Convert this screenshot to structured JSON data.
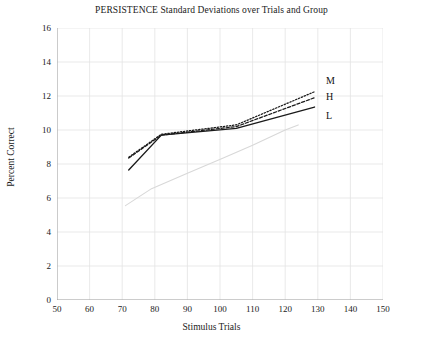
{
  "chart_data": {
    "type": "line",
    "title": "PERSISTENCE Standard Deviations over Trials and Group",
    "xlabel": "Stimulus Trials",
    "ylabel": "Percent Correct",
    "xlim": [
      50,
      150
    ],
    "ylim": [
      0,
      16
    ],
    "xticks": [
      50,
      60,
      70,
      80,
      90,
      100,
      110,
      120,
      130,
      140,
      150
    ],
    "yticks": [
      0,
      2,
      4,
      6,
      8,
      10,
      12,
      14,
      16
    ],
    "grid": true,
    "legend_position": "right-end-of-line",
    "series": [
      {
        "name": "M",
        "style": "dotted",
        "color": "#1a1a1a",
        "x": [
          72,
          82,
          105,
          129
        ],
        "values": [
          8.4,
          9.75,
          10.3,
          12.25
        ]
      },
      {
        "name": "H",
        "style": "dashed",
        "color": "#1a1a1a",
        "x": [
          72,
          82,
          105,
          129
        ],
        "values": [
          8.35,
          9.7,
          10.2,
          11.9
        ]
      },
      {
        "name": "L",
        "style": "solid",
        "color": "#1a1a1a",
        "x": [
          72,
          82,
          105,
          129
        ],
        "values": [
          7.65,
          9.7,
          10.1,
          11.35
        ]
      }
    ],
    "artifact_line": {
      "name": "faint-scan-artifact",
      "style": "solid-light",
      "color": "#d8d8d8",
      "x": [
        71,
        79,
        90,
        101,
        110,
        120,
        124
      ],
      "values": [
        5.55,
        6.55,
        7.45,
        8.35,
        9.1,
        10.0,
        10.3
      ]
    }
  },
  "axes": {
    "y_tick_labels": [
      "16",
      "14",
      "12",
      "10",
      "8",
      "6",
      "4",
      "2",
      "0"
    ],
    "x_tick_labels": [
      "50",
      "60",
      "70",
      "80",
      "90",
      "100",
      "110",
      "120",
      "130",
      "140",
      "150"
    ]
  },
  "colors": {
    "ink": "#1a1a1a",
    "grid": "#e3e3e3",
    "axis": "#9a9a9a",
    "artifact": "#d9d9d9",
    "background": "#ffffff"
  }
}
